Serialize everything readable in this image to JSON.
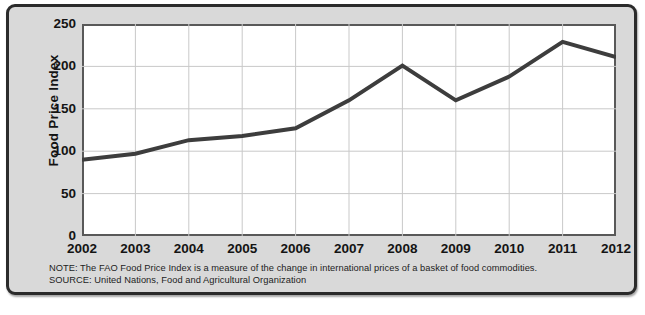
{
  "chart_data": {
    "type": "line",
    "title": "",
    "xlabel": "",
    "ylabel": "Food Price Index",
    "categories": [
      "2002",
      "2003",
      "2004",
      "2005",
      "2006",
      "2007",
      "2008",
      "2009",
      "2010",
      "2011",
      "2012"
    ],
    "x": [
      2002,
      2003,
      2004,
      2005,
      2006,
      2007,
      2008,
      2009,
      2010,
      2011,
      2012
    ],
    "values": [
      90,
      97,
      113,
      118,
      127,
      160,
      201,
      160,
      188,
      229,
      211
    ],
    "series": [
      {
        "name": "FAO Food Price Index",
        "values": [
          90,
          97,
          113,
          118,
          127,
          160,
          201,
          160,
          188,
          229,
          211
        ]
      }
    ],
    "ylim": [
      0,
      250
    ],
    "ytick_labels": [
      "0",
      "50",
      "100",
      "150",
      "200",
      "250"
    ],
    "yticks": [
      0,
      50,
      100,
      150,
      200,
      250
    ],
    "xlim": [
      2002,
      2012
    ],
    "grid": true,
    "legend": "none",
    "line_color": "#3d3d3d"
  },
  "axes": {
    "y_title": "Food Price Index",
    "y_labels": [
      "250",
      "200",
      "150",
      "100",
      "50",
      "0"
    ],
    "x_labels": [
      "2002",
      "2003",
      "2004",
      "2005",
      "2006",
      "2007",
      "2008",
      "2009",
      "2010",
      "2011",
      "2012"
    ]
  },
  "footnotes": {
    "note": "NOTE: The FAO Food Price Index is a measure of the change in international prices of a basket of food commodities.",
    "source": "SOURCE: United Nations, Food and Agricultural Organization"
  },
  "colors": {
    "card_background": "#d9d9d9",
    "card_border": "#2b2b2b",
    "plot_background": "#ffffff",
    "plot_border": "#595959",
    "gridline": "#c9c9c9",
    "line": "#3d3d3d",
    "text": "#141414"
  }
}
